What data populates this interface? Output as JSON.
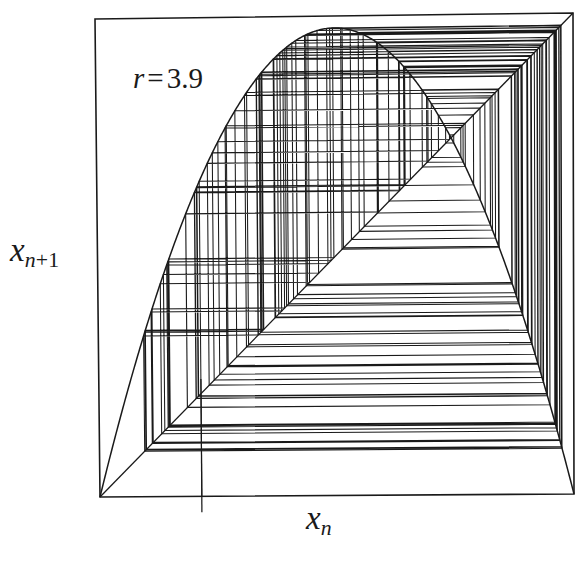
{
  "figure": {
    "kind": "cobweb-diagram",
    "caption_text": null,
    "background_color": "#ffffff",
    "ink_color": "#1a1a1a"
  },
  "labels": {
    "x_axis": {
      "var": "x",
      "sub": "n",
      "full": "x_n"
    },
    "y_axis": {
      "var": "x",
      "sub": "n+1",
      "sub_base": "n",
      "sub_extra": "+1",
      "full": "x_n+1"
    },
    "parameter": {
      "symbol": "r",
      "equals": "=",
      "value": "3.9",
      "full": "r = 3.9"
    }
  },
  "chart_data": {
    "type": "line",
    "title": "",
    "subtitle": "",
    "xlabel": "x_n",
    "ylabel": "x_n+1",
    "annotations": [
      {
        "text": "r = 3.9",
        "x_frac": 0.09,
        "y_frac": 0.88
      }
    ],
    "legend": [],
    "legend_position": "none",
    "grid": false,
    "xlim": [
      0,
      1
    ],
    "ylim": [
      0,
      1
    ],
    "xticks": [],
    "yticks": [],
    "map": {
      "name": "logistic map",
      "equation": "x_{n+1} = r * x_n * (1 - x_n)",
      "r": 3.9,
      "x0": 0.215,
      "iterations": 120,
      "peak": {
        "x": 0.5,
        "y": 0.975
      },
      "fixed_point": {
        "x": 0.7436,
        "y": 0.7436
      }
    },
    "series": [
      {
        "name": "logistic parabola f(x) = 3.9 x (1 - x)",
        "role": "map-curve"
      },
      {
        "name": "identity line y = x",
        "role": "diagonal"
      },
      {
        "name": "cobweb orbit",
        "role": "cobweb"
      }
    ],
    "frame": {
      "note": "scanned figure, plot box slightly skewed",
      "top_left": [
        95,
        19
      ],
      "top_right": [
        573,
        13
      ],
      "bottom_right": [
        574,
        494
      ],
      "bottom_left": [
        100,
        497
      ]
    },
    "start_tick": {
      "x_frac": 0.215,
      "extends_below_axis_px": 16
    }
  }
}
